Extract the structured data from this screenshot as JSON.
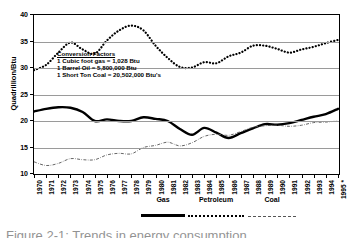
{
  "chart_data": {
    "type": "line",
    "title": "",
    "xlabel": "",
    "ylabel": "Quadrillion/Btu",
    "ylim": [
      10,
      40
    ],
    "yticks": [
      10,
      15,
      20,
      25,
      30,
      35,
      40
    ],
    "grid": true,
    "legend_position": "bottom",
    "categories": [
      "1970",
      "1971",
      "1972",
      "1973",
      "1974",
      "1975",
      "1976",
      "1977",
      "1978",
      "1979",
      "1980",
      "1981",
      "1982",
      "1983",
      "1984",
      "1985",
      "1986",
      "1987",
      "1988",
      "1989",
      "1990",
      "1991",
      "1992",
      "1993",
      "1994",
      "1995 *"
    ],
    "series": [
      {
        "name": "Gas",
        "style": "solid-thick",
        "color": "#000000",
        "values": [
          21.8,
          22.3,
          22.6,
          22.5,
          21.7,
          20.0,
          20.3,
          20.0,
          20.0,
          20.7,
          20.4,
          20.0,
          18.5,
          17.4,
          18.7,
          17.8,
          16.8,
          17.7,
          18.6,
          19.4,
          19.3,
          19.6,
          20.2,
          20.8,
          21.3,
          22.3
        ]
      },
      {
        "name": "Petroleum",
        "style": "dotted",
        "color": "#000000",
        "values": [
          29.6,
          30.6,
          32.9,
          34.8,
          33.5,
          32.7,
          35.2,
          37.1,
          38.0,
          37.1,
          34.2,
          31.9,
          30.2,
          30.1,
          31.1,
          30.9,
          32.2,
          32.9,
          34.2,
          34.2,
          33.6,
          32.9,
          33.5,
          34.0,
          34.7,
          35.3
        ]
      },
      {
        "name": "Coal",
        "style": "dash-dot-thin",
        "color": "#555555",
        "values": [
          12.3,
          11.6,
          12.0,
          12.9,
          12.7,
          12.7,
          13.6,
          13.9,
          13.8,
          15.0,
          15.4,
          16.0,
          15.3,
          15.9,
          17.1,
          17.5,
          17.3,
          18.0,
          18.8,
          19.1,
          19.2,
          19.0,
          19.2,
          19.7,
          19.8,
          20.0
        ]
      }
    ],
    "annotation": {
      "title": "Conversion Factors",
      "lines": [
        "1 Cubic foot gas = 1,028 Btu",
        "1 Barrel Oil = 5,800,000 Btu",
        "1 Short Ton Coal = 20,502,000 Btu's"
      ]
    }
  },
  "legend": {
    "entries": [
      {
        "label": "Gas"
      },
      {
        "label": "Petroleum"
      },
      {
        "label": "Coal"
      }
    ]
  },
  "caption": {
    "text": "Figure 2-1:  Trends in energy consumption"
  }
}
